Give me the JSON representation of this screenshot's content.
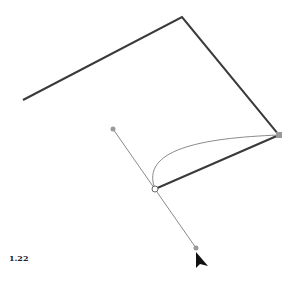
{
  "figure": {
    "caption": "1.22",
    "path_points": [
      [
        23,
        100
      ],
      [
        182,
        17
      ],
      [
        279,
        135
      ],
      [
        155,
        189
      ]
    ],
    "curve": {
      "from": [
        279,
        135
      ],
      "c1": [
        200,
        140
      ],
      "c2": [
        140,
        150
      ],
      "to": [
        155,
        189
      ]
    },
    "handle_line": {
      "start": [
        113,
        129
      ],
      "end": [
        196,
        248
      ]
    },
    "anchor": [
      155,
      189
    ],
    "handle_points": [
      [
        113,
        129
      ],
      [
        196,
        248
      ]
    ],
    "corner_point": [
      279,
      135
    ],
    "cursor": [
      196,
      255
    ],
    "colors": {
      "path": "#3a3a3a",
      "guide": "#8a8a8a",
      "handle": "#999999"
    }
  }
}
